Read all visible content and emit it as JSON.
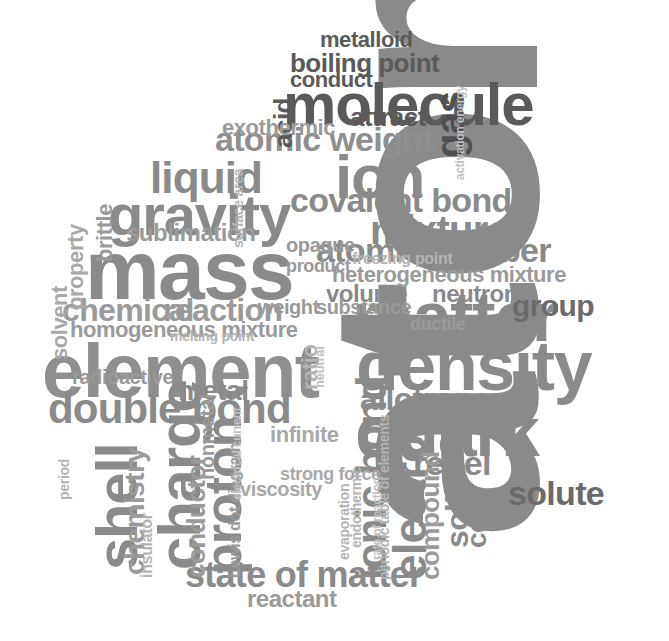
{
  "image": {
    "type": "word-cloud",
    "title": "Chemistry Terms Word Cloud",
    "shape": "blob/cloud silhouette",
    "background_color": "#ffffff",
    "width": 669,
    "height": 641,
    "palette": {
      "darkest": "#4a4a4a",
      "dark": "#5f5f5f",
      "mid": "#808080",
      "light": "#a8a8a8",
      "lighter": "#c0c0c0",
      "faint": "#d4d4d4",
      "faintest": "#e2e2e2"
    }
  },
  "chart_data": {
    "type": "word-cloud",
    "xlabel": "",
    "ylabel": "",
    "legend": [],
    "grid": false,
    "words": [
      {
        "text": "atom",
        "weight": 100,
        "color": "#8a8a8a",
        "size": 300,
        "rot": -90,
        "x": 295,
        "y": 540
      },
      {
        "text": "bond",
        "weight": 72,
        "color": "#4f4f4f",
        "size": 126,
        "rot": -90,
        "x": 556,
        "y": 1102
      },
      {
        "text": "mass",
        "weight": 62,
        "color": "#8a8a8a",
        "size": 84,
        "rot": 0,
        "x": 85,
        "y": 232
      },
      {
        "text": "element",
        "weight": 60,
        "color": "#8f8f8f",
        "size": 76,
        "rot": 0,
        "x": 42,
        "y": 336
      },
      {
        "text": "matter",
        "weight": 58,
        "color": "#8a8a8a",
        "size": 70,
        "rot": 0,
        "x": 352,
        "y": 285
      },
      {
        "text": "density",
        "weight": 58,
        "color": "#8a8a8a",
        "size": 70,
        "rot": 0,
        "x": 356,
        "y": 334
      },
      {
        "text": "quark",
        "weight": 57,
        "color": "#8a8a8a",
        "size": 70,
        "rot": 0,
        "x": 355,
        "y": 400
      },
      {
        "text": "molecule",
        "weight": 55,
        "color": "#5a5a5a",
        "size": 60,
        "rot": 0,
        "x": 283,
        "y": 77
      },
      {
        "text": "gravity",
        "weight": 50,
        "color": "#8a8a8a",
        "size": 58,
        "rot": 0,
        "x": 108,
        "y": 188
      },
      {
        "text": "charge",
        "weight": 50,
        "color": "#8a8a8a",
        "size": 60,
        "rot": -90,
        "x": 152,
        "y": 570
      },
      {
        "text": "ion",
        "weight": 48,
        "color": "#8a8a8a",
        "size": 62,
        "rot": 0,
        "x": 335,
        "y": 148
      },
      {
        "text": "shell",
        "weight": 46,
        "color": "#8a8a8a",
        "size": 58,
        "rot": -90,
        "x": 90,
        "y": 570
      },
      {
        "text": "proton",
        "weight": 45,
        "color": "#8a8a8a",
        "size": 52,
        "rot": -90,
        "x": 200,
        "y": 575
      },
      {
        "text": "dissolve",
        "weight": 44,
        "color": "#6b6b6b",
        "size": 48,
        "rot": -90,
        "x": 598,
        "y": 1085
      },
      {
        "text": "electron",
        "weight": 42,
        "color": "#8a8a8a",
        "size": 46,
        "rot": -90,
        "x": 389,
        "y": 580
      },
      {
        "text": "ionic bond",
        "weight": 42,
        "color": "#8a8a8a",
        "size": 42,
        "rot": -90,
        "x": 353,
        "y": 580
      },
      {
        "text": "atomic weight",
        "weight": 40,
        "color": "#8f8f8f",
        "size": 34,
        "rot": 0,
        "x": 215,
        "y": 124
      },
      {
        "text": "liquid",
        "weight": 40,
        "color": "#8a8a8a",
        "size": 44,
        "rot": 0,
        "x": 150,
        "y": 158
      },
      {
        "text": "double bond",
        "weight": 40,
        "color": "#8a8a8a",
        "size": 42,
        "rot": 0,
        "x": 48,
        "y": 390
      },
      {
        "text": "mixture",
        "weight": 38,
        "color": "#8a8a8a",
        "size": 40,
        "rot": 0,
        "x": 370,
        "y": 212
      },
      {
        "text": "covalent bond",
        "weight": 38,
        "color": "#8a8a8a",
        "size": 34,
        "rot": 0,
        "x": 290,
        "y": 185
      },
      {
        "text": "atomic number",
        "weight": 38,
        "color": "#8a8a8a",
        "size": 34,
        "rot": 0,
        "x": 316,
        "y": 235
      },
      {
        "text": "valance electrons",
        "weight": 36,
        "color": "#6b6b6b",
        "size": 28,
        "rot": -90,
        "x": 528,
        "y": 1090
      },
      {
        "text": "state of matter",
        "weight": 35,
        "color": "#8a8a8a",
        "size": 36,
        "rot": 0,
        "x": 185,
        "y": 558
      },
      {
        "text": "nucleus",
        "weight": 34,
        "color": "#6b6b6b",
        "size": 34,
        "rot": -90,
        "x": 630,
        "y": 1080
      },
      {
        "text": "solute",
        "weight": 34,
        "color": "#6b6b6b",
        "size": 34,
        "rot": 0,
        "x": 508,
        "y": 478
      },
      {
        "text": "chemical",
        "weight": 33,
        "color": "#9a9a9a",
        "size": 32,
        "rot": 0,
        "x": 62,
        "y": 296
      },
      {
        "text": "reaction",
        "weight": 33,
        "color": "#9a9a9a",
        "size": 32,
        "rot": 0,
        "x": 163,
        "y": 296
      },
      {
        "text": "allotrope",
        "weight": 32,
        "color": "#8a8a8a",
        "size": 32,
        "rot": 0,
        "x": 360,
        "y": 385
      },
      {
        "text": "repel",
        "weight": 32,
        "color": "#8a8a8a",
        "size": 34,
        "rot": 0,
        "x": 413,
        "y": 448
      },
      {
        "text": "gas",
        "weight": 32,
        "color": "#4f4f4f",
        "size": 40,
        "rot": -90,
        "x": 432,
        "y": 158
      },
      {
        "text": "group",
        "weight": 31,
        "color": "#6b6b6b",
        "size": 30,
        "rot": 0,
        "x": 512,
        "y": 292
      },
      {
        "text": "solid",
        "weight": 30,
        "color": "#8a8a8a",
        "size": 32,
        "rot": -90,
        "x": 443,
        "y": 548
      },
      {
        "text": "metal",
        "weight": 28,
        "color": "#8a8a8a",
        "size": 28,
        "rot": 0,
        "x": 178,
        "y": 378
      },
      {
        "text": "chemistry",
        "weight": 28,
        "color": "#9a9a9a",
        "size": 28,
        "rot": -90,
        "x": 122,
        "y": 575
      },
      {
        "text": "compound",
        "weight": 27,
        "color": "#9a9a9a",
        "size": 26,
        "rot": -90,
        "x": 419,
        "y": 580
      },
      {
        "text": "conductor",
        "weight": 27,
        "color": "#9a9a9a",
        "size": 26,
        "rot": -90,
        "x": 185,
        "y": 578
      },
      {
        "text": "heterogeneous mixture",
        "weight": 26,
        "color": "#9a9a9a",
        "size": 22,
        "rot": 0,
        "x": 332,
        "y": 265
      },
      {
        "text": "homogeneous mixture",
        "weight": 26,
        "color": "#9a9a9a",
        "size": 22,
        "rot": 0,
        "x": 70,
        "y": 320
      },
      {
        "text": "neutron",
        "weight": 25,
        "color": "#8a8a8a",
        "size": 24,
        "rot": 0,
        "x": 432,
        "y": 283
      },
      {
        "text": "volume",
        "weight": 24,
        "color": "#8a8a8a",
        "size": 24,
        "rot": 0,
        "x": 326,
        "y": 283
      },
      {
        "text": "sublimation",
        "weight": 24,
        "color": "#9a9a9a",
        "size": 24,
        "rot": 0,
        "x": 126,
        "y": 222
      },
      {
        "text": "attract",
        "weight": 24,
        "color": "#5a5a5a",
        "size": 26,
        "rot": 0,
        "x": 350,
        "y": 106
      },
      {
        "text": "boiling point",
        "weight": 24,
        "color": "#5a5a5a",
        "size": 26,
        "rot": 0,
        "x": 290,
        "y": 52
      },
      {
        "text": "metalloid",
        "weight": 23,
        "color": "#5a5a5a",
        "size": 22,
        "rot": 0,
        "x": 320,
        "y": 30
      },
      {
        "text": "conduct",
        "weight": 22,
        "color": "#5a5a5a",
        "size": 22,
        "rot": 0,
        "x": 290,
        "y": 70
      },
      {
        "text": "core",
        "weight": 22,
        "color": "#8a8a8a",
        "size": 28,
        "rot": -90,
        "x": 464,
        "y": 548
      },
      {
        "text": "solvent",
        "weight": 21,
        "color": "#a8a8a8",
        "size": 22,
        "rot": -90,
        "x": 50,
        "y": 360
      },
      {
        "text": "property",
        "weight": 21,
        "color": "#a8a8a8",
        "size": 22,
        "rot": -90,
        "x": 66,
        "y": 310
      },
      {
        "text": "brittle",
        "weight": 21,
        "color": "#9a9a9a",
        "size": 22,
        "rot": -90,
        "x": 95,
        "y": 262
      },
      {
        "text": "nonmetal",
        "weight": 20,
        "color": "#9a9a9a",
        "size": 20,
        "rot": -90,
        "x": 198,
        "y": 480
      },
      {
        "text": "infinite",
        "weight": 20,
        "color": "#a8a8a8",
        "size": 22,
        "rot": 0,
        "x": 270,
        "y": 425
      },
      {
        "text": "viscosity",
        "weight": 20,
        "color": "#a8a8a8",
        "size": 20,
        "rot": 0,
        "x": 240,
        "y": 480
      },
      {
        "text": "strong force",
        "weight": 19,
        "color": "#a8a8a8",
        "size": 18,
        "rot": 0,
        "x": 280,
        "y": 466
      },
      {
        "text": "weight",
        "weight": 19,
        "color": "#9a9a9a",
        "size": 20,
        "rot": 0,
        "x": 258,
        "y": 298
      },
      {
        "text": "substance",
        "weight": 19,
        "color": "#9a9a9a",
        "size": 20,
        "rot": 0,
        "x": 316,
        "y": 298
      },
      {
        "text": "ductile",
        "weight": 18,
        "color": "#9a9a9a",
        "size": 18,
        "rot": 0,
        "x": 410,
        "y": 316
      },
      {
        "text": "reactant",
        "weight": 18,
        "color": "#9a9a9a",
        "size": 24,
        "rot": 0,
        "x": 247,
        "y": 588
      },
      {
        "text": "acid",
        "weight": 18,
        "color": "#5a5a5a",
        "size": 26,
        "rot": -90,
        "x": 272,
        "y": 148
      },
      {
        "text": "exothermic",
        "weight": 18,
        "color": "#9a9a9a",
        "size": 22,
        "rot": 0,
        "x": 222,
        "y": 118
      },
      {
        "text": "freezing point",
        "weight": 16,
        "color": "#b4b4b4",
        "size": 16,
        "rot": 0,
        "x": 352,
        "y": 252
      },
      {
        "text": "melting point",
        "weight": 15,
        "color": "#b4b4b4",
        "size": 14,
        "rot": 0,
        "x": 170,
        "y": 330
      },
      {
        "text": "radioactive",
        "weight": 16,
        "color": "#9a9a9a",
        "size": 20,
        "rot": 0,
        "x": 72,
        "y": 368
      },
      {
        "text": "periodic table of elements",
        "weight": 15,
        "color": "#b4b4b4",
        "size": 14,
        "rot": -90,
        "x": 378,
        "y": 580
      },
      {
        "text": "Lewis dot diagram",
        "weight": 15,
        "color": "#9a9a9a",
        "size": 16,
        "rot": -90,
        "x": 228,
        "y": 578
      },
      {
        "text": "insulator",
        "weight": 14,
        "color": "#b4b4b4",
        "size": 16,
        "rot": -90,
        "x": 140,
        "y": 578
      },
      {
        "text": "concentration",
        "weight": 14,
        "color": "#b4b4b4",
        "size": 14,
        "rot": -90,
        "x": 578,
        "y": 1060
      },
      {
        "text": "evaporation",
        "weight": 14,
        "color": "#b4b4b4",
        "size": 14,
        "rot": -90,
        "x": 338,
        "y": 560
      },
      {
        "text": "endothermic",
        "weight": 14,
        "color": "#b4b4b4",
        "size": 14,
        "rot": -90,
        "x": 350,
        "y": 548
      },
      {
        "text": "period",
        "weight": 13,
        "color": "#b4b4b4",
        "size": 14,
        "rot": -90,
        "x": 58,
        "y": 500
      },
      {
        "text": "activation energy",
        "weight": 12,
        "color": "#c0c0c0",
        "size": 12,
        "rot": -90,
        "x": 455,
        "y": 180
      },
      {
        "text": "surface area",
        "weight": 12,
        "color": "#b4b4b4",
        "size": 14,
        "rot": -90,
        "x": 232,
        "y": 248
      },
      {
        "text": "electrical current",
        "weight": 12,
        "color": "#c0c0c0",
        "size": 12,
        "rot": -90,
        "x": 232,
        "y": 500
      },
      {
        "text": "rate of reaction",
        "weight": 12,
        "color": "#c0c0c0",
        "size": 12,
        "rot": -90,
        "x": 372,
        "y": 560
      },
      {
        "text": "ratio",
        "weight": 12,
        "color": "#b4b4b4",
        "size": 22,
        "rot": -90,
        "x": 300,
        "y": 390
      },
      {
        "text": "neutral",
        "weight": 12,
        "color": "#c0c0c0",
        "size": 13,
        "rot": -90,
        "x": 314,
        "y": 388
      },
      {
        "text": "opaque",
        "weight": 14,
        "color": "#9a9a9a",
        "size": 20,
        "rot": 0,
        "x": 286,
        "y": 236
      },
      {
        "text": "product",
        "weight": 14,
        "color": "#9a9a9a",
        "size": 18,
        "rot": 0,
        "x": 286,
        "y": 258
      }
    ]
  },
  "word_list": [
    "atom",
    "bond",
    "mass",
    "element",
    "matter",
    "density",
    "quark",
    "molecule",
    "gravity",
    "charge",
    "ion",
    "shell",
    "proton",
    "dissolve",
    "electron",
    "ionic bond",
    "atomic weight",
    "liquid",
    "double bond",
    "mixture",
    "covalent bond",
    "atomic number",
    "valance electrons",
    "state of matter",
    "nucleus",
    "solute",
    "chemical",
    "reaction",
    "allotrope",
    "repel",
    "gas",
    "group",
    "solid",
    "metal",
    "chemistry",
    "compound",
    "conductor",
    "heterogeneous mixture",
    "homogeneous mixture",
    "neutron",
    "volume",
    "sublimation",
    "attract",
    "boiling point",
    "metalloid",
    "conduct",
    "core",
    "solvent",
    "property",
    "brittle",
    "nonmetal",
    "infinite",
    "viscosity",
    "strong force",
    "weight",
    "substance",
    "ductile",
    "reactant",
    "acid",
    "exothermic",
    "freezing point",
    "melting point",
    "radioactive",
    "periodic table of elements",
    "Lewis dot diagram",
    "insulator",
    "concentration",
    "evaporation",
    "endothermic",
    "period",
    "activation energy",
    "surface area",
    "electrical current",
    "rate of reaction",
    "ratio",
    "neutral",
    "opaque",
    "product",
    "medium",
    "chemical reaction",
    "nucleus",
    "solute"
  ]
}
